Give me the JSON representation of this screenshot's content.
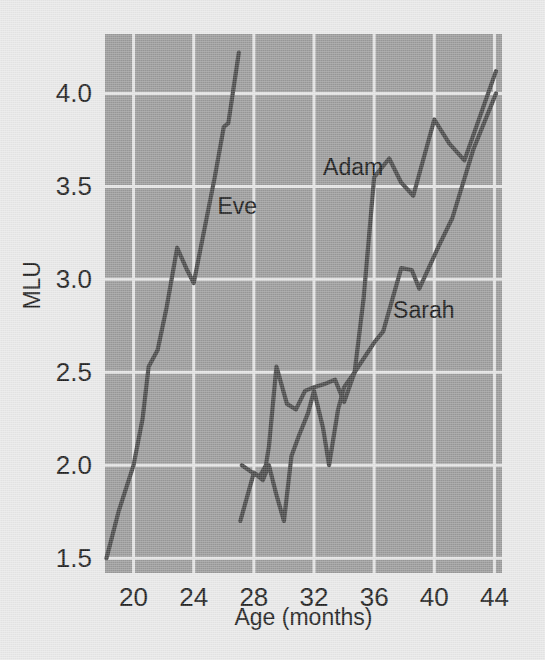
{
  "figure": {
    "background_color": "#e9e9e9",
    "plot_background_color": "#9a9a9a",
    "gridline_color": "#e4e4e4",
    "line_color": "#484848",
    "text_color": "#1d1d1d"
  },
  "axes": {
    "x": {
      "title": "Age (months)",
      "tick_labels": [
        "20",
        "24",
        "28",
        "32",
        "36",
        "40",
        "44"
      ],
      "tick_values": [
        20,
        24,
        28,
        32,
        36,
        40,
        44
      ],
      "range": [
        18.1,
        44.5
      ]
    },
    "y": {
      "title": "MLU",
      "tick_labels": [
        "1.5",
        "2.0",
        "2.5",
        "3.0",
        "3.5",
        "4.0"
      ],
      "tick_values": [
        1.5,
        2.0,
        2.5,
        3.0,
        3.5,
        4.0
      ],
      "range": [
        1.42,
        4.32
      ]
    }
  },
  "series_labels": {
    "eve": "Eve",
    "adam": "Adam",
    "sarah": "Sarah"
  },
  "chart_data": {
    "type": "line",
    "title": "",
    "xlabel": "Age (months)",
    "ylabel": "MLU",
    "xlim": [
      18.1,
      44.5
    ],
    "ylim": [
      1.42,
      4.32
    ],
    "grid": true,
    "legend": "inline-labels",
    "xticks": [
      20,
      24,
      28,
      32,
      36,
      40,
      44
    ],
    "yticks": [
      1.5,
      2.0,
      2.5,
      3.0,
      3.5,
      4.0
    ],
    "series": [
      {
        "name": "Eve",
        "label_position": {
          "age": 26.9,
          "mlu": 3.35
        },
        "points": [
          {
            "age": 18.2,
            "mlu": 1.5
          },
          {
            "age": 19.0,
            "mlu": 1.75
          },
          {
            "age": 20.0,
            "mlu": 2.0
          },
          {
            "age": 20.6,
            "mlu": 2.25
          },
          {
            "age": 21.0,
            "mlu": 2.53
          },
          {
            "age": 21.6,
            "mlu": 2.62
          },
          {
            "age": 22.2,
            "mlu": 2.85
          },
          {
            "age": 22.9,
            "mlu": 3.17
          },
          {
            "age": 23.5,
            "mlu": 3.06
          },
          {
            "age": 24.0,
            "mlu": 2.98
          },
          {
            "age": 25.4,
            "mlu": 3.55
          },
          {
            "age": 26.0,
            "mlu": 3.82
          },
          {
            "age": 26.3,
            "mlu": 3.84
          },
          {
            "age": 27.0,
            "mlu": 4.22
          }
        ]
      },
      {
        "name": "Adam",
        "label_position": {
          "age": 34.6,
          "mlu": 3.56
        },
        "points": [
          {
            "age": 27.1,
            "mlu": 1.7
          },
          {
            "age": 28.0,
            "mlu": 1.96
          },
          {
            "age": 28.6,
            "mlu": 1.92
          },
          {
            "age": 29.0,
            "mlu": 2.0
          },
          {
            "age": 29.5,
            "mlu": 1.84
          },
          {
            "age": 30.0,
            "mlu": 1.7
          },
          {
            "age": 30.5,
            "mlu": 2.05
          },
          {
            "age": 31.0,
            "mlu": 2.16
          },
          {
            "age": 31.6,
            "mlu": 2.28
          },
          {
            "age": 32.0,
            "mlu": 2.4
          },
          {
            "age": 32.6,
            "mlu": 2.2
          },
          {
            "age": 33.0,
            "mlu": 2.0
          },
          {
            "age": 33.6,
            "mlu": 2.3
          },
          {
            "age": 34.0,
            "mlu": 2.42
          },
          {
            "age": 34.7,
            "mlu": 2.5
          },
          {
            "age": 35.3,
            "mlu": 2.9
          },
          {
            "age": 36.0,
            "mlu": 3.55
          },
          {
            "age": 37.0,
            "mlu": 3.65
          },
          {
            "age": 37.8,
            "mlu": 3.52
          },
          {
            "age": 38.6,
            "mlu": 3.45
          },
          {
            "age": 40.0,
            "mlu": 3.86
          },
          {
            "age": 41.0,
            "mlu": 3.73
          },
          {
            "age": 42.0,
            "mlu": 3.64
          },
          {
            "age": 44.1,
            "mlu": 4.12
          }
        ]
      },
      {
        "name": "Sarah",
        "label_position": {
          "age": 39.3,
          "mlu": 2.79
        },
        "points": [
          {
            "age": 27.2,
            "mlu": 2.0
          },
          {
            "age": 27.9,
            "mlu": 1.96
          },
          {
            "age": 28.4,
            "mlu": 1.94
          },
          {
            "age": 28.8,
            "mlu": 2.0
          },
          {
            "age": 29.0,
            "mlu": 2.1
          },
          {
            "age": 29.5,
            "mlu": 2.53
          },
          {
            "age": 30.2,
            "mlu": 2.33
          },
          {
            "age": 30.8,
            "mlu": 2.3
          },
          {
            "age": 31.4,
            "mlu": 2.4
          },
          {
            "age": 32.0,
            "mlu": 2.42
          },
          {
            "age": 32.8,
            "mlu": 2.44
          },
          {
            "age": 33.4,
            "mlu": 2.46
          },
          {
            "age": 34.0,
            "mlu": 2.34
          },
          {
            "age": 34.7,
            "mlu": 2.5
          },
          {
            "age": 36.0,
            "mlu": 2.66
          },
          {
            "age": 36.6,
            "mlu": 2.72
          },
          {
            "age": 37.8,
            "mlu": 3.06
          },
          {
            "age": 38.5,
            "mlu": 3.05
          },
          {
            "age": 39.0,
            "mlu": 2.95
          },
          {
            "age": 40.3,
            "mlu": 3.18
          },
          {
            "age": 41.2,
            "mlu": 3.33
          },
          {
            "age": 42.6,
            "mlu": 3.7
          },
          {
            "age": 44.1,
            "mlu": 4.0
          }
        ]
      }
    ]
  }
}
